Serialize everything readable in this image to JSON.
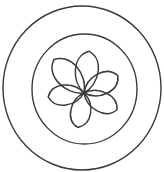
{
  "figure": {
    "stroke_color": "#3a3a3a",
    "background_color": "#ffffff",
    "outer_circle": {
      "cx": 82,
      "cy": 88,
      "rx": 79,
      "ry": 82
    },
    "inner_circle": {
      "cx": 84.5,
      "cy": 89,
      "rx": 52.5,
      "ry": 55
    },
    "flower": {
      "center": {
        "x": 84,
        "y": 93
      },
      "petal_count": 6,
      "petals": [
        {
          "name": "top",
          "angle": -83,
          "length": 42,
          "width": 16
        },
        {
          "name": "upper-right",
          "angle": -27,
          "length": 38,
          "width": 15
        },
        {
          "name": "lower-right",
          "angle": 27,
          "length": 37,
          "width": 14
        },
        {
          "name": "bottom",
          "angle": 100,
          "length": 35,
          "width": 14
        },
        {
          "name": "left",
          "angle": 174,
          "length": 36,
          "width": 14
        },
        {
          "name": "upper-left",
          "angle": -132,
          "length": 45,
          "width": 17
        }
      ]
    }
  }
}
